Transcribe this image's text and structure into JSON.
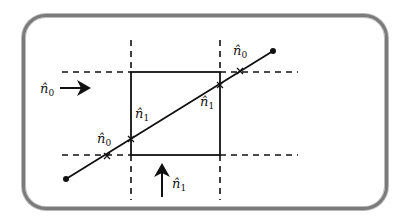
{
  "diagram": {
    "colors": {
      "frame": "#7a7a7a",
      "line": "#111111",
      "background": "#ffffff"
    },
    "labels": {
      "incoming_left": {
        "base": "n̂",
        "sub": "0"
      },
      "incoming_bottom": {
        "base": "n̂",
        "sub": "1"
      },
      "cross_lower_left": {
        "base": "n̂",
        "sub": "0"
      },
      "cross_upper_right": {
        "base": "n̂",
        "sub": "0"
      },
      "box_left_intersect": {
        "base": "n̂",
        "sub": "1"
      },
      "box_right_intersect": {
        "base": "n̂",
        "sub": "1"
      }
    },
    "box": {
      "x1": 131,
      "y1": 72,
      "x2": 220,
      "y2": 155
    },
    "ray": {
      "start": [
        66,
        179
      ],
      "end": [
        273,
        51
      ]
    },
    "crosses": [
      [
        107,
        156
      ],
      [
        240,
        71
      ]
    ],
    "arrows": [
      {
        "name": "arrow-right",
        "from": [
          60,
          88
        ],
        "to": [
          91,
          88
        ]
      },
      {
        "name": "arrow-up",
        "from": [
          162,
          197
        ],
        "to": [
          162,
          163
        ]
      }
    ]
  }
}
